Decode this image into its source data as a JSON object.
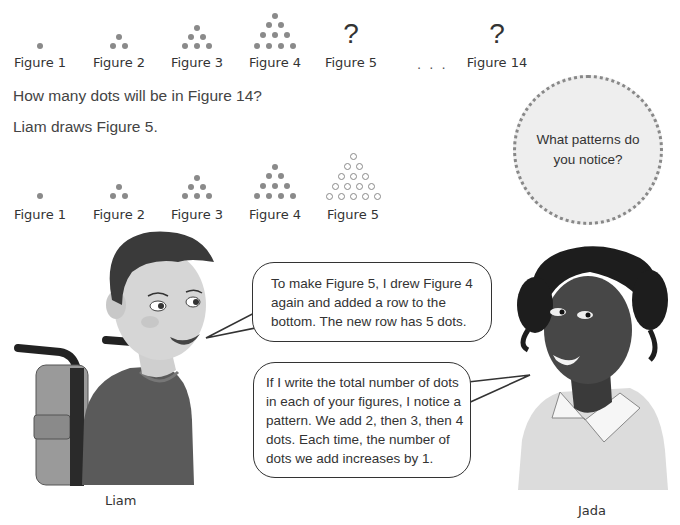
{
  "top_sequence": {
    "figures": [
      {
        "label": "Figure 1",
        "rows": [
          1
        ],
        "display": "dots"
      },
      {
        "label": "Figure 2",
        "rows": [
          1,
          2
        ],
        "display": "dots"
      },
      {
        "label": "Figure 3",
        "rows": [
          1,
          2,
          3
        ],
        "display": "dots"
      },
      {
        "label": "Figure 4",
        "rows": [
          1,
          2,
          3,
          4
        ],
        "display": "dots"
      },
      {
        "label": "Figure 5",
        "display": "unknown",
        "symbol": "?"
      },
      {
        "label": "Figure 14",
        "display": "unknown",
        "symbol": "?"
      }
    ],
    "ellipsis": ". . ."
  },
  "question": "How many dots will be in Figure 14?",
  "statement": "Liam draws Figure 5.",
  "notice_prompt": "What patterns do you notice?",
  "liam_sequence": {
    "figures": [
      {
        "label": "Figure 1",
        "rows": [
          1
        ],
        "style": "filled"
      },
      {
        "label": "Figure 2",
        "rows": [
          1,
          2
        ],
        "style": "filled"
      },
      {
        "label": "Figure 3",
        "rows": [
          1,
          2,
          3
        ],
        "style": "filled"
      },
      {
        "label": "Figure 4",
        "rows": [
          1,
          2,
          3,
          4
        ],
        "style": "filled"
      },
      {
        "label": "Figure 5",
        "rows": [
          1,
          2,
          3,
          4,
          5
        ],
        "style": "open"
      }
    ]
  },
  "characters": {
    "liam": {
      "name": "Liam",
      "speech": "To make Figure 5, I drew Figure 4 again and added a row to the bottom. The new row has 5 dots."
    },
    "jada": {
      "name": "Jada",
      "speech": "If I write the total number of dots in each of your figures, I notice a pattern. We add 2, then 3, then 4 dots. Each time, the number of dots we add increases by 1."
    }
  },
  "colors": {
    "dot": "#8a8a8a",
    "text": "#333333",
    "notice_fill": "#eeeeee"
  }
}
